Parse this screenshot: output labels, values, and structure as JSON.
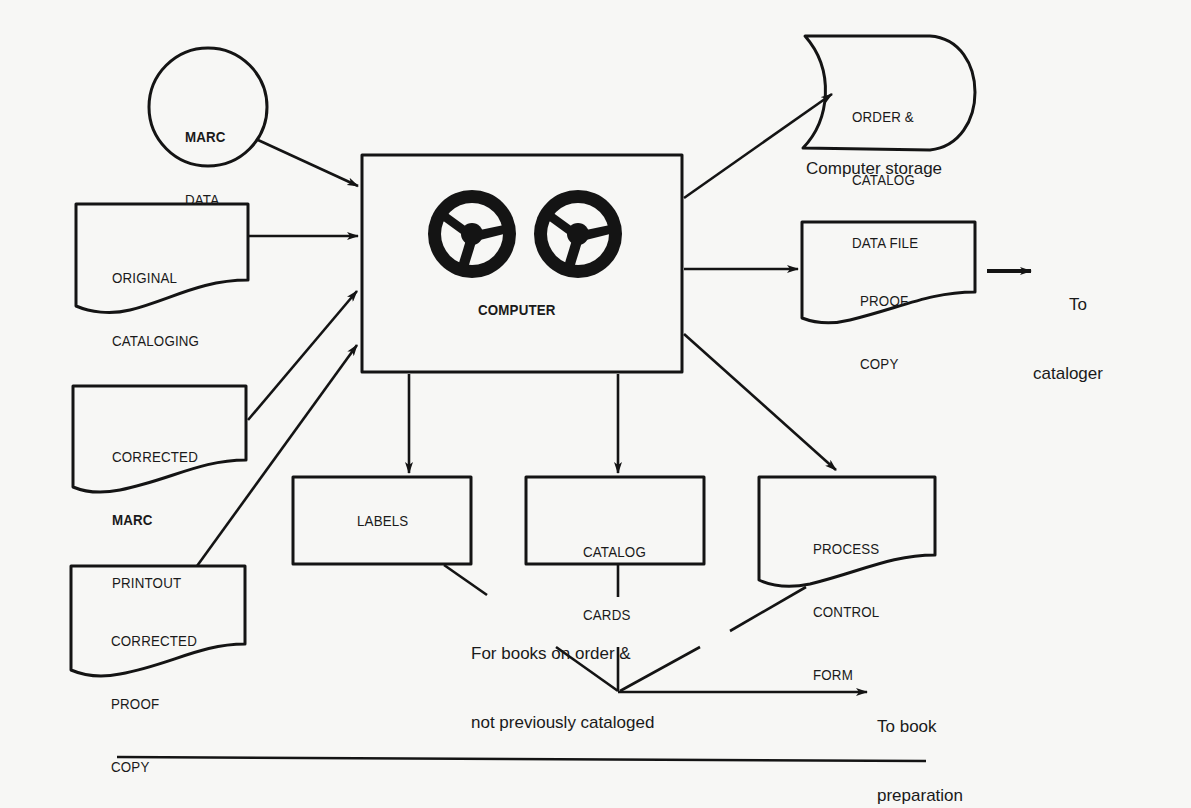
{
  "diagram": {
    "type": "flowchart",
    "style": {
      "stroke": "#141414",
      "background": "#f7f7f5"
    },
    "nodes": {
      "marc_data": {
        "shape": "circle",
        "line1": "MARC",
        "line2": "DATA"
      },
      "original_cataloging": {
        "shape": "document",
        "line1": "ORIGINAL",
        "line2": "CATALOGING"
      },
      "corrected_marc_printout": {
        "shape": "document",
        "line1": "CORRECTED",
        "line2": "MARC",
        "line3": "PRINTOUT"
      },
      "corrected_proof_copy": {
        "shape": "document",
        "line1": "CORRECTED",
        "line2": "PROOF",
        "line3": "COPY"
      },
      "computer": {
        "shape": "process",
        "label": "COMPUTER",
        "icon": "tape-reels-icon"
      },
      "order_catalog_data_file": {
        "shape": "stored-data",
        "line1": "ORDER &",
        "line2": "CATALOG",
        "line3": "DATA FILE",
        "caption": "Computer storage"
      },
      "proof_copy": {
        "shape": "document",
        "line1": "PROOF",
        "line2": "COPY"
      },
      "labels": {
        "shape": "rectangle",
        "label": "LABELS"
      },
      "catalog_cards": {
        "shape": "rectangle",
        "line1": "CATALOG",
        "line2": "CARDS"
      },
      "process_control_form": {
        "shape": "document",
        "line1": "PROCESS",
        "line2": "CONTROL",
        "line3": "FORM"
      }
    },
    "annotations": {
      "to_cataloger": {
        "line1": "To",
        "line2": "cataloger"
      },
      "for_books": {
        "line1": "For books on order &",
        "line2": "not previously cataloged"
      },
      "to_book_preparation": {
        "line1": "To book",
        "line2": "preparation"
      }
    },
    "edges": [
      {
        "from": "MARC DATA",
        "to": "COMPUTER"
      },
      {
        "from": "ORIGINAL CATALOGING",
        "to": "COMPUTER"
      },
      {
        "from": "CORRECTED MARC PRINTOUT",
        "to": "COMPUTER"
      },
      {
        "from": "CORRECTED PROOF COPY",
        "to": "COMPUTER"
      },
      {
        "from": "COMPUTER",
        "to": "ORDER & CATALOG DATA FILE"
      },
      {
        "from": "COMPUTER",
        "to": "PROOF COPY"
      },
      {
        "from": "PROOF COPY",
        "to": "To cataloger"
      },
      {
        "from": "COMPUTER",
        "to": "LABELS"
      },
      {
        "from": "COMPUTER",
        "to": "CATALOG CARDS"
      },
      {
        "from": "COMPUTER",
        "to": "PROCESS CONTROL FORM"
      },
      {
        "from": "LABELS",
        "to": "To book preparation"
      },
      {
        "from": "CATALOG CARDS",
        "to": "To book preparation"
      },
      {
        "from": "PROCESS CONTROL FORM",
        "to": "To book preparation"
      }
    ]
  }
}
